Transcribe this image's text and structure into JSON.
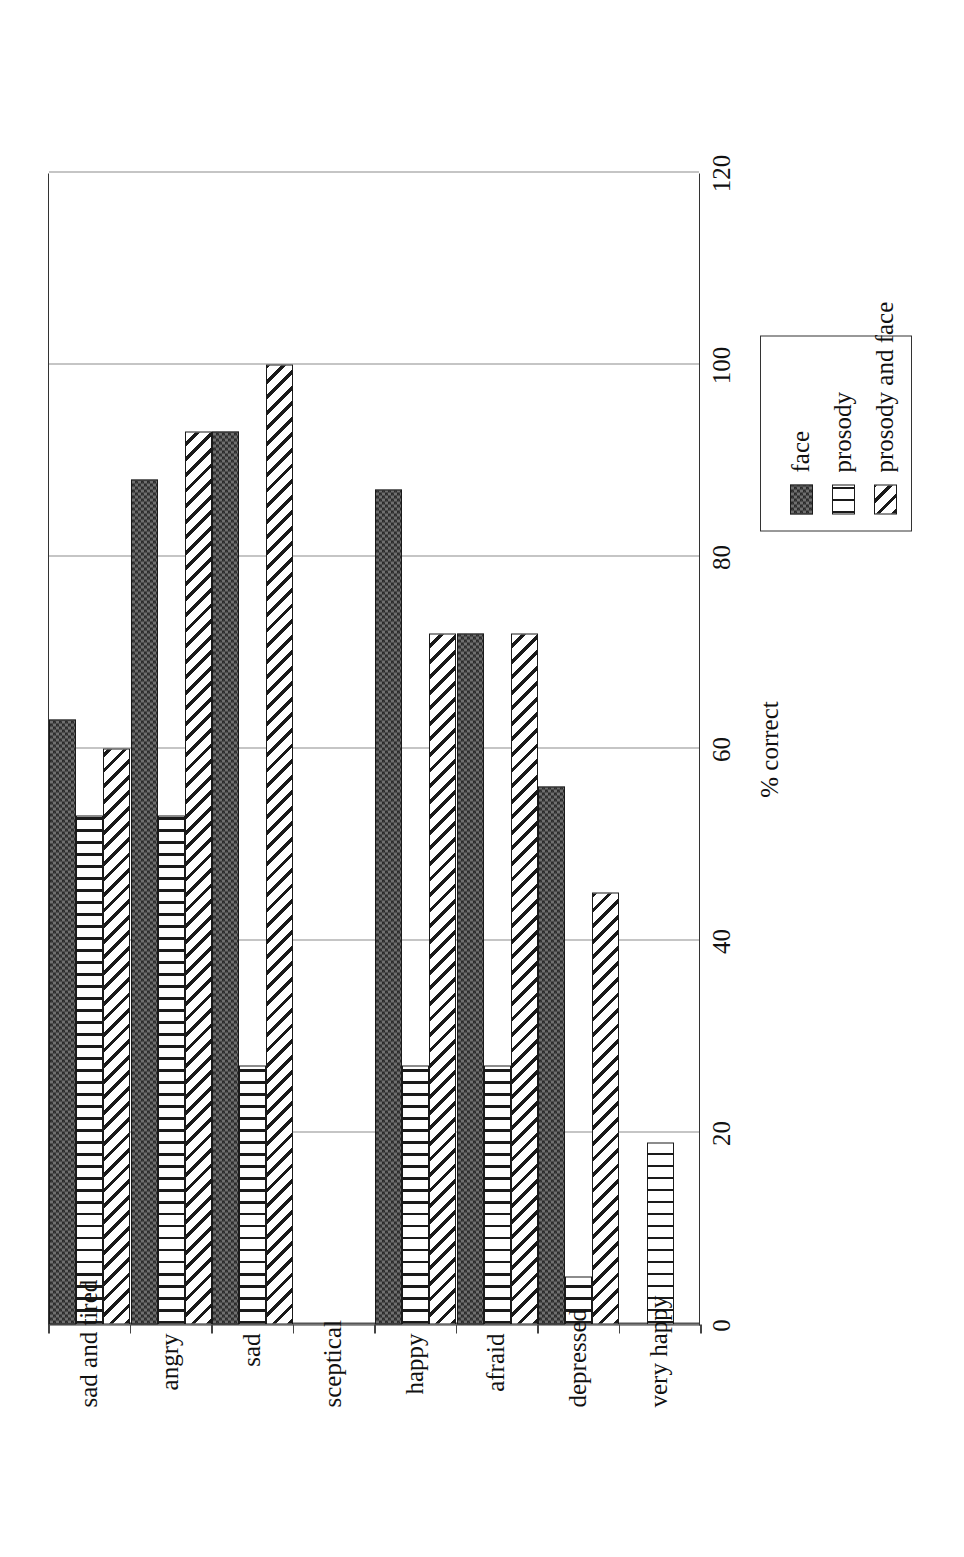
{
  "chart_data": {
    "type": "bar",
    "orientation": "horizontal",
    "title": "",
    "xlabel": "% correct",
    "ylabel": "",
    "xlim": [
      0,
      120
    ],
    "xticks": [
      0,
      20,
      40,
      60,
      80,
      100,
      120
    ],
    "grid": true,
    "legend_position": "right-outside",
    "categories": [
      "sad and tired",
      "angry",
      "sad",
      "sceptical",
      "happy",
      "afraid",
      "depressed",
      "very happy"
    ],
    "series": [
      {
        "name": "face",
        "pattern": "checkerboard",
        "values": [
          63,
          88,
          93,
          0,
          87,
          72,
          56,
          0
        ]
      },
      {
        "name": "prosody",
        "pattern": "vertical-lines",
        "values": [
          53,
          53,
          27,
          0,
          27,
          27,
          5,
          19
        ]
      },
      {
        "name": "prosody and face",
        "pattern": "diagonal-hatch",
        "values": [
          60,
          93,
          100,
          0,
          72,
          72,
          45,
          0
        ]
      }
    ]
  },
  "axis": {
    "x_title": "% correct",
    "tick_labels": [
      "0",
      "20",
      "40",
      "60",
      "80",
      "100",
      "120"
    ],
    "category_labels": [
      "sad and tired",
      "angry",
      "sad",
      "sceptical",
      "happy",
      "afraid",
      "depressed",
      "very happy"
    ]
  },
  "legend": {
    "items": [
      {
        "label": "face"
      },
      {
        "label": "prosody"
      },
      {
        "label": "prosody and face"
      }
    ]
  },
  "colors": {
    "ink": "#1a1a1a",
    "grid": "#8c8c8c",
    "frame": "#333333",
    "background": "#ffffff"
  }
}
